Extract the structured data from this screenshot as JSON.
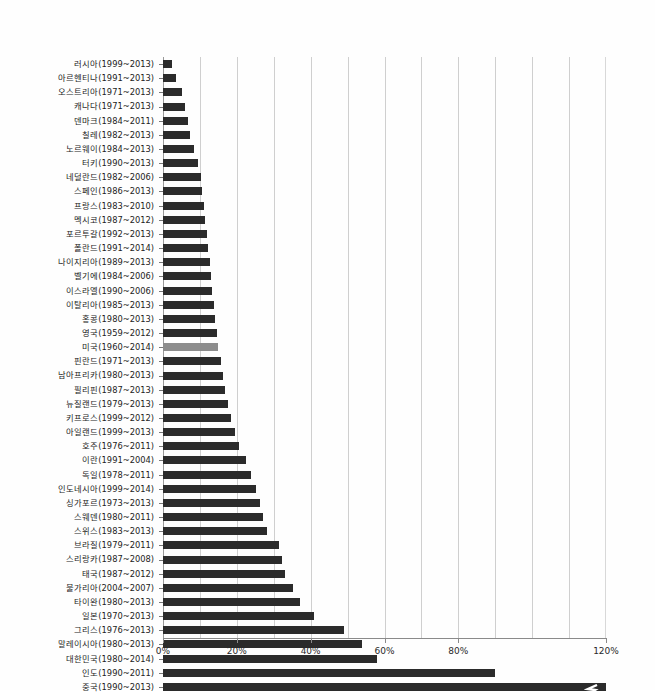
{
  "chart_data": {
    "type": "bar",
    "orientation": "horizontal",
    "title": "",
    "subtitle": "",
    "xlabel": "",
    "ylabel": "",
    "xlim": [
      0,
      120
    ],
    "xtick_labels": [
      "0%",
      "20%",
      "40%",
      "60%",
      "80%",
      "120%"
    ],
    "xtick_values": [
      0,
      20,
      40,
      60,
      80,
      120
    ],
    "gridlines": [
      10,
      20,
      30,
      40,
      50,
      60,
      70,
      80,
      90,
      100,
      110
    ],
    "grid": true,
    "legend": "none",
    "bar_color": "#2b2b2b",
    "highlight_color": "#8d8d8d",
    "highlight_category": "미국(1960~2014)",
    "note": "마지막 막대(중국)는 축 절단 표시",
    "categories": [
      "러시아(1999~2013)",
      "아르헨티나(1991~2013)",
      "오스트리아(1971~2013)",
      "캐나다(1971~2013)",
      "덴마크(1984~2011)",
      "칠레(1982~2013)",
      "노르웨이(1984~2013)",
      "터키(1990~2013)",
      "네덜란드(1982~2006)",
      "스페인(1986~2013)",
      "프랑스(1983~2010)",
      "멕시코(1987~2012)",
      "포르투갈(1992~2013)",
      "폴란드(1991~2014)",
      "나이지리아(1989~2013)",
      "벨기에(1984~2006)",
      "이스라엘(1990~2006)",
      "이탈리아(1985~2013)",
      "홍콩(1980~2013)",
      "영국(1959~2012)",
      "미국(1960~2014)",
      "핀란드(1971~2013)",
      "남아프리카(1980~2013)",
      "필리핀(1987~2013)",
      "뉴질랜드(1979~2013)",
      "키프로스(1999~2012)",
      "아일랜드(1999~2013)",
      "호주(1976~2011)",
      "이란(1991~2004)",
      "독일(1978~2011)",
      "인도네시아(1999~2014)",
      "싱가포르(1973~2013)",
      "스웨덴(1980~2011)",
      "스위스(1983~2013)",
      "브라질(1979~2011)",
      "스리랑카(1987~2008)",
      "태국(1987~2012)",
      "불가리아(2004~2007)",
      "타이완(1980~2013)",
      "일본(1970~2013)",
      "그리스(1976~2013)",
      "말레이시아(1980~2013)",
      "대한민국(1980~2014)",
      "인도(1990~2011)",
      "중국(1990~2013)"
    ],
    "values": [
      2.5,
      3.6,
      5.2,
      6.0,
      6.8,
      7.3,
      8.3,
      9.5,
      10.2,
      10.6,
      11.0,
      11.4,
      11.8,
      12.2,
      12.6,
      13.0,
      13.4,
      13.8,
      14.2,
      14.6,
      15.0,
      15.6,
      16.2,
      16.8,
      17.5,
      18.4,
      19.5,
      20.6,
      22.4,
      23.8,
      25.2,
      26.2,
      27.2,
      28.2,
      31.4,
      32.2,
      33.0,
      35.2,
      37.0,
      41.0,
      49.0,
      54.0,
      58.0,
      90.0,
      122.0
    ],
    "value_unit": "%"
  },
  "axis": {
    "ticks": [
      {
        "label": "0%",
        "value": 0
      },
      {
        "label": "20%",
        "value": 20
      },
      {
        "label": "40%",
        "value": 40
      },
      {
        "label": "60%",
        "value": 60
      },
      {
        "label": "80%",
        "value": 80
      },
      {
        "label": "120%",
        "value": 120
      }
    ]
  }
}
